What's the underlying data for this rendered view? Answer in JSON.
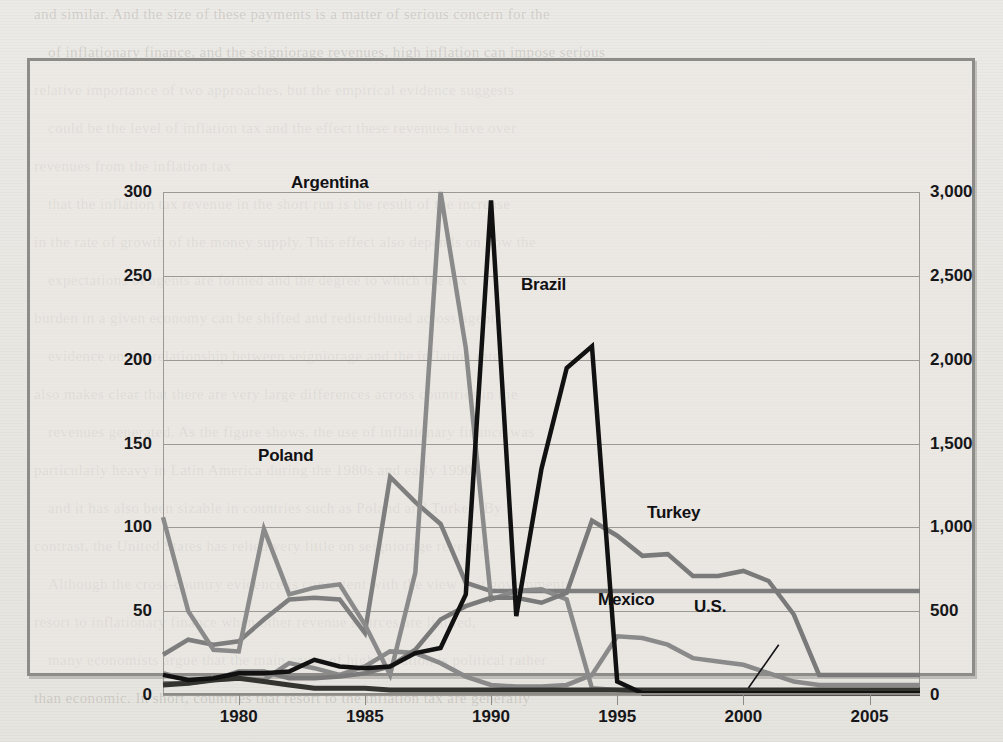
{
  "chart_data": {
    "type": "line",
    "title": "",
    "xlabel": "",
    "ylabel": "",
    "y_left": {
      "ticks": [
        "0",
        "50",
        "100",
        "150",
        "200",
        "250",
        "300"
      ],
      "values": [
        0,
        50,
        100,
        150,
        200,
        250,
        300
      ],
      "lim": [
        0,
        300
      ]
    },
    "y_right": {
      "ticks": [
        "0",
        "500",
        "1,000",
        "1,500",
        "2,000",
        "2,500",
        "3,000"
      ],
      "values": [
        0,
        500,
        1000,
        1500,
        2000,
        2500,
        3000
      ],
      "lim": [
        0,
        3000
      ]
    },
    "x": {
      "ticks": [
        "1980",
        "1985",
        "1990",
        "1995",
        "2000",
        "2005"
      ],
      "values": [
        1980,
        1985,
        1990,
        1995,
        2000,
        2005
      ],
      "lim": [
        1977,
        2007
      ]
    },
    "grid": true,
    "legend_position": "inline-annotations",
    "years": [
      1977,
      1978,
      1979,
      1980,
      1981,
      1982,
      1983,
      1984,
      1985,
      1986,
      1987,
      1988,
      1989,
      1990,
      1991,
      1992,
      1993,
      1994,
      1995,
      1996,
      1997,
      1998,
      1999,
      2000,
      2001,
      2002,
      2003,
      2004,
      2005,
      2006,
      2007
    ],
    "series": [
      {
        "name": "Argentina",
        "color": "#8a8a8a",
        "axis": "left",
        "values": [
          106,
          50,
          27,
          26,
          99,
          60,
          64,
          66,
          42,
          12,
          73,
          300,
          207,
          57,
          62,
          63,
          57,
          4,
          3,
          2,
          1,
          1,
          1,
          1,
          1,
          1,
          1,
          1,
          1,
          1,
          1
        ]
      },
      {
        "name": "Brazil",
        "color": "#111111",
        "axis": "left",
        "values": [
          12,
          9,
          10,
          13,
          13,
          14,
          21,
          17,
          16,
          17,
          25,
          28,
          60,
          295,
          47,
          135,
          195,
          208,
          8,
          1,
          1,
          1,
          1,
          1,
          1,
          1,
          1,
          1,
          1,
          1,
          1
        ]
      },
      {
        "name": "Poland",
        "color": "#7e7e7e",
        "axis": "left",
        "values": [
          24,
          33,
          30,
          32,
          45,
          57,
          58,
          57,
          37,
          130,
          115,
          102,
          67,
          62,
          62,
          62,
          62,
          62,
          62,
          62,
          62,
          62,
          62,
          62,
          62,
          62,
          62,
          62,
          62,
          62,
          62
        ]
      },
      {
        "name": "Turkey",
        "color": "#7a7a7a",
        "axis": "left",
        "values": [
          7,
          7,
          9,
          14,
          14,
          10,
          10,
          11,
          13,
          17,
          27,
          45,
          53,
          58,
          58,
          55,
          61,
          104,
          95,
          83,
          84,
          71,
          71,
          74,
          68,
          48,
          12,
          12,
          12,
          12,
          12
        ]
      },
      {
        "name": "Mexico",
        "color": "#8a8a8a",
        "axis": "left",
        "values": [
          13,
          9,
          9,
          10,
          9,
          19,
          16,
          12,
          17,
          26,
          25,
          19,
          11,
          6,
          5,
          5,
          6,
          12,
          35,
          34,
          30,
          22,
          20,
          18,
          13,
          8,
          6,
          6,
          6,
          6,
          6
        ]
      },
      {
        "name": "U.S.",
        "color": "#33332f",
        "axis": "left",
        "values": [
          6,
          7,
          9,
          10,
          8,
          6,
          4,
          4,
          4,
          3,
          3,
          3,
          3,
          3,
          3,
          3,
          3,
          3,
          3,
          3,
          3,
          3,
          3,
          3,
          3,
          3,
          3,
          3,
          3,
          3,
          3
        ]
      }
    ],
    "annotations": [
      {
        "text": "Argentina",
        "x_px": 288,
        "y_px": 170
      },
      {
        "text": "Brazil",
        "x_px": 518,
        "y_px": 272
      },
      {
        "text": "Poland",
        "x_px": 255,
        "y_px": 443
      },
      {
        "text": "Turkey",
        "x_px": 644,
        "y_px": 500
      },
      {
        "text": "Mexico",
        "x_px": 595,
        "y_px": 587
      },
      {
        "text": "U.S.",
        "x_px": 691,
        "y_px": 594
      }
    ]
  },
  "ghost_text": {
    "lines": [
      "and similar. And the size of these payments is a matter of serious concern for the",
      "of inflationary finance, and the seigniorage revenues, high inflation can impose serious",
      "relative importance of two approaches, but the empirical evidence suggests",
      "could be the level of inflation tax and the effect these revenues have over",
      "revenues from the inflation tax",
      "that the inflation tax revenue in the short run is the result of the increase",
      "in the rate of growth of the money supply. This effect also depends on how the",
      "expectations of agents are formed and the degree to which the tax",
      "burden in a given economy can be shifted and redistributed across agents.",
      "evidence on the relationship between seigniorage and the inflation rate",
      "also makes clear that there are very large differences across countries in the",
      "revenues generated. As the figure shows, the use of inflationary finance was",
      "particularly heavy in Latin America during the 1980s and early 1990s,",
      "and it has also been sizable in countries such as Poland and Turkey. By",
      "contrast, the United States has relied very little on seigniorage revenue.",
      "Although the cross-country evidence is consistent with the view that governments",
      "resort to inflationary finance when other revenue sources are limited,",
      "many economists argue that the main cause of high inflation is political rather",
      "than economic. In short, countries that resort to the inflation tax are generally"
    ]
  }
}
